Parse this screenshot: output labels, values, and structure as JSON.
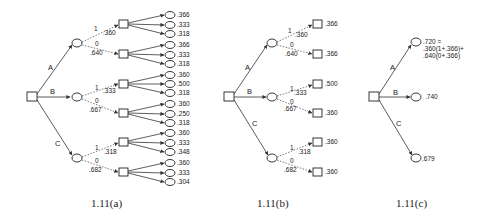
{
  "figure": {
    "captions": {
      "a": "1.11(a)",
      "b": "1.11(b)",
      "c": "1.11(c)"
    },
    "branches": {
      "A": "A",
      "B": "B",
      "C": "C"
    },
    "outcome_labels": {
      "one": "1",
      "zero": "0"
    },
    "a": {
      "A": {
        "p1": ".360",
        "p0": ".640",
        "leaves1": [
          ".366",
          ".333",
          ".318"
        ],
        "leaves0": [
          ".366",
          ".333",
          ".318"
        ]
      },
      "B": {
        "p1": ".333",
        "p0": ".667",
        "leaves1": [
          ".360",
          ".500",
          ".318"
        ],
        "leaves0": [
          ".360",
          ".250",
          ".318"
        ]
      },
      "C": {
        "p1": ".318",
        "p0": ".682",
        "leaves1": [
          ".360",
          ".333",
          ".348"
        ],
        "leaves0": [
          ".360",
          ".333",
          ".304"
        ]
      }
    },
    "b": {
      "A": {
        "p1": ".360",
        "p0": ".640",
        "v1": ".366",
        "v0": ".366"
      },
      "B": {
        "p1": ".333",
        "p0": ".667",
        "v1": ".500",
        "v0": ".360"
      },
      "C": {
        "p1": ".318",
        "p0": ".682",
        "v1": ".360",
        "v0": ".360"
      }
    },
    "c": {
      "A": {
        "line1": ".720 =",
        "line2": ".360(1+.366)+",
        "line3": ".640(0+.366)"
      },
      "B": ".740",
      "C": ".679"
    }
  }
}
